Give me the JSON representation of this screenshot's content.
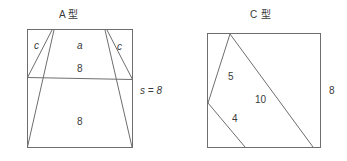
{
  "figures": [
    {
      "id": "figure-a",
      "title": "A 型",
      "labels": {
        "c_left": "c",
        "a_top": "a",
        "c_right": "c",
        "eight_mid": "8",
        "eight_bottom": "8",
        "side": "s = 8"
      }
    },
    {
      "id": "figure-c",
      "title": "C 型",
      "labels": {
        "five": "5",
        "ten": "10",
        "four": "4",
        "side": "8"
      }
    }
  ],
  "style": {
    "stroke": "#6e6e6e",
    "text": "#3a3a3a",
    "background": "#ffffff"
  }
}
